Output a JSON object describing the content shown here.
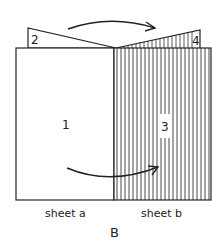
{
  "figure": {
    "panel_label": "B",
    "labels": {
      "region_1": "1",
      "region_2": "2",
      "region_3": "3",
      "region_4": "4"
    },
    "captions": {
      "sheet_a": "sheet a",
      "sheet_b": "sheet b"
    },
    "colors": {
      "line": "#222222",
      "background": "#ffffff"
    }
  }
}
